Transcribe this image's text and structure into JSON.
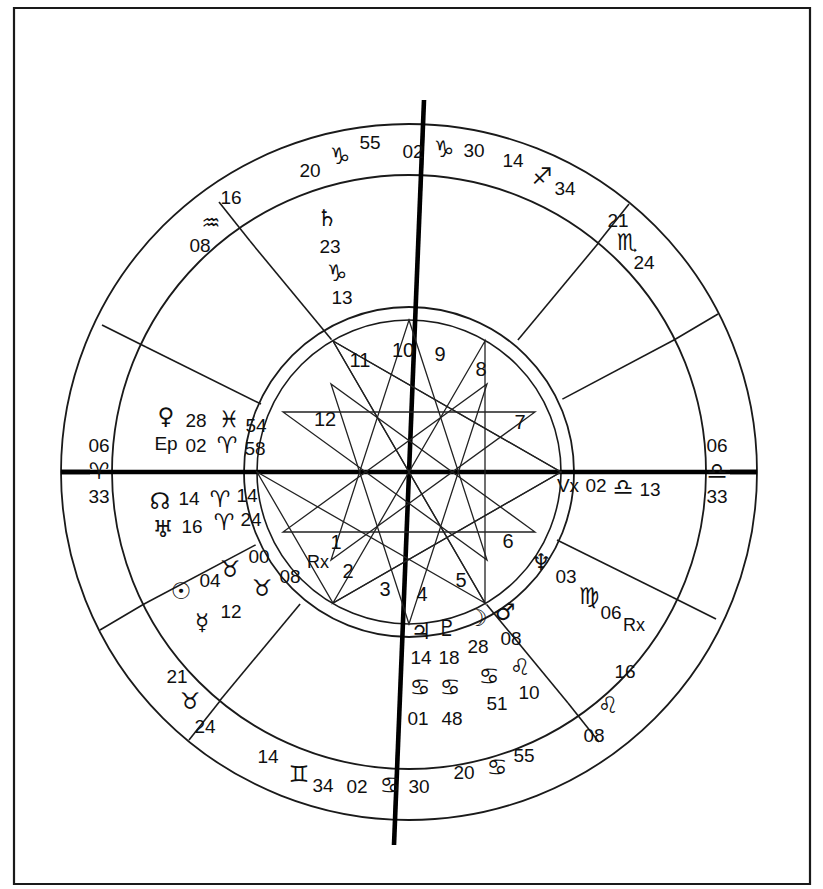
{
  "chart": {
    "type": "astrological-natal-wheel",
    "angles": {
      "ascendant": {
        "name": "Ascendant",
        "degree": "06",
        "sign_glyph": "♈",
        "sign_name": "Aries",
        "minute": "33"
      },
      "descendant": {
        "name": "Descendant",
        "degree": "06",
        "sign_glyph": "♎",
        "sign_name": "Libra",
        "minute": "33"
      },
      "midheaven": {
        "name": "Midheaven",
        "degree": "02",
        "sign_glyph": "♑",
        "sign_name": "Capricorn",
        "minute": "30"
      },
      "imum_coeli": {
        "name": "Imum Coeli",
        "degree": "02",
        "sign_glyph": "♋",
        "sign_name": "Cancer",
        "minute": "30"
      }
    },
    "house_cusps": [
      {
        "house": 1,
        "degree": "06",
        "sign_glyph": "♈",
        "sign_name": "Aries",
        "minute": "33"
      },
      {
        "house": 2,
        "degree": "21",
        "sign_glyph": "♉",
        "sign_name": "Taurus",
        "minute": "24"
      },
      {
        "house": 3,
        "degree": "14",
        "sign_glyph": "♊",
        "sign_name": "Gemini",
        "minute": "34"
      },
      {
        "house": 4,
        "degree": "02",
        "sign_glyph": "♋",
        "sign_name": "Cancer",
        "minute": "30"
      },
      {
        "house": 5,
        "degree": "20",
        "sign_glyph": "♋",
        "sign_name": "Cancer",
        "minute": "55"
      },
      {
        "house": 6,
        "degree": "16",
        "sign_glyph": "♌",
        "sign_name": "Leo",
        "minute": "08"
      },
      {
        "house": 7,
        "degree": "06",
        "sign_glyph": "♎",
        "sign_name": "Libra",
        "minute": "33"
      },
      {
        "house": 8,
        "degree": "21",
        "sign_glyph": "♏",
        "sign_name": "Scorpio",
        "minute": "24"
      },
      {
        "house": 9,
        "degree": "14",
        "sign_glyph": "♐",
        "sign_name": "Sagittarius",
        "minute": "34"
      },
      {
        "house": 10,
        "degree": "02",
        "sign_glyph": "♑",
        "sign_name": "Capricorn",
        "minute": "30"
      },
      {
        "house": 11,
        "degree": "20",
        "sign_glyph": "♑",
        "sign_name": "Capricorn",
        "minute": "55"
      },
      {
        "house": 12,
        "degree": "16",
        "sign_glyph": "♒",
        "sign_name": "Aquarius",
        "minute": "08"
      }
    ],
    "house_numbers": [
      "1",
      "2",
      "3",
      "4",
      "5",
      "6",
      "7",
      "8",
      "9",
      "10",
      "11",
      "12"
    ],
    "placements": [
      {
        "body": "Saturn",
        "glyph": "♄",
        "degree": "23",
        "sign_glyph": "♑",
        "sign_name": "Capricorn",
        "minute": "13",
        "retrograde": false
      },
      {
        "body": "Venus",
        "glyph": "♀",
        "degree": "28",
        "sign_glyph": "♓",
        "sign_name": "Pisces",
        "minute": "54",
        "retrograde": false
      },
      {
        "body": "East Point",
        "glyph": "Ep",
        "degree": "02",
        "sign_glyph": "♈",
        "sign_name": "Aries",
        "minute": "58",
        "retrograde": false
      },
      {
        "body": "North Node",
        "glyph": "☊",
        "degree": "14",
        "sign_glyph": "♈",
        "sign_name": "Aries",
        "minute": "14",
        "retrograde": false
      },
      {
        "body": "Uranus",
        "glyph": "♅",
        "degree": "16",
        "sign_glyph": "♈",
        "sign_name": "Aries",
        "minute": "24",
        "retrograde": false
      },
      {
        "body": "Chiron",
        "glyph": "♉",
        "degree": "00",
        "sign_glyph": "♉",
        "sign_name": "Taurus",
        "minute": "08",
        "retrograde": true
      },
      {
        "body": "Sun",
        "glyph": "☉",
        "degree": "04",
        "sign_glyph": "",
        "sign_name": "",
        "minute": "",
        "retrograde": false
      },
      {
        "body": "Mercury",
        "glyph": "☿",
        "degree": "12",
        "sign_glyph": "",
        "sign_name": "",
        "minute": "",
        "retrograde": false
      },
      {
        "body": "Jupiter",
        "glyph": "♃",
        "degree": "14",
        "sign_glyph": "♋",
        "sign_name": "Cancer",
        "minute": "01",
        "retrograde": false
      },
      {
        "body": "Pluto",
        "glyph": "♇",
        "degree": "18",
        "sign_glyph": "♋",
        "sign_name": "Cancer",
        "minute": "48",
        "retrograde": false
      },
      {
        "body": "Moon",
        "glyph": "☽",
        "degree": "28",
        "sign_glyph": "♋",
        "sign_name": "Cancer",
        "minute": "51",
        "retrograde": false
      },
      {
        "body": "Mars",
        "glyph": "♂",
        "degree": "08",
        "sign_glyph": "♌",
        "sign_name": "Leo",
        "minute": "10",
        "retrograde": false
      },
      {
        "body": "Neptune",
        "glyph": "♆",
        "degree": "03",
        "sign_glyph": "♍",
        "sign_name": "Virgo",
        "minute": "06",
        "retrograde": true
      },
      {
        "body": "Vertex",
        "glyph": "Vx",
        "degree": "02",
        "sign_glyph": "♎",
        "sign_name": "Libra",
        "minute": "13",
        "retrograde": false
      }
    ],
    "retrograde_marker": "Rx",
    "labels": {
      "asc_deg": "06",
      "asc_glyph": "♈",
      "asc_min": "33",
      "dsc_deg": "06",
      "dsc_glyph": "♎",
      "dsc_min": "33",
      "mc_deg": "02",
      "mc_glyph": "♑",
      "mc_min": "30",
      "ic_deg": "02",
      "ic_glyph": "♋",
      "ic_min": "30",
      "c11_deg": "20",
      "c11_glyph": "♑",
      "c11_min": "55",
      "c12_deg": "16",
      "c12_glyph": "♒",
      "c12_min": "08",
      "c9_deg": "14",
      "c9_glyph": "♐",
      "c9_min": "34",
      "c8_deg": "21",
      "c8_glyph": "♏",
      "c8_min": "24",
      "c2_deg": "21",
      "c2_glyph": "♉",
      "c2_min": "24",
      "c3_deg": "14",
      "c3_glyph": "♊",
      "c3_min": "34",
      "c5_deg": "20",
      "c5_glyph": "♋",
      "c5_min": "55",
      "c6_deg": "16",
      "c6_glyph": "♌",
      "c6_min": "08",
      "saturn_glyph": "♄",
      "saturn_deg": "23",
      "saturn_sign": "♑",
      "saturn_min": "13",
      "venus_glyph": "♀",
      "venus_deg": "28",
      "venus_sign": "♓",
      "venus_min": "54",
      "ep_glyph": "Ep",
      "ep_deg": "02",
      "ep_sign": "♈",
      "ep_min": "58",
      "node_glyph": "☊",
      "node_deg": "14",
      "node_sign": "♈",
      "node_min": "14",
      "uranus_glyph": "♅",
      "uranus_deg": "16",
      "uranus_sign": "♈",
      "uranus_min": "24",
      "chiron_glyph": "♉",
      "chiron_deg": "00",
      "chiron_sign": "♉",
      "chiron_min": "08",
      "chiron_rx": "Rx",
      "sun_glyph": "☉",
      "sun_deg": "04",
      "mercury_glyph": "☿",
      "mercury_deg": "12",
      "jupiter_glyph": "♃",
      "pluto_glyph": "♇",
      "jupiter_deg": "14",
      "pluto_deg": "18",
      "jupiter_sign": "♋",
      "pluto_sign": "♋",
      "jupiter_min": "01",
      "pluto_min": "48",
      "moon_glyph": "☽",
      "mars_glyph": "♂",
      "moon_deg": "28",
      "mars_deg": "08",
      "moon_sign": "♋",
      "mars_sign": "♌",
      "moon_min": "51",
      "mars_min": "10",
      "neptune_glyph": "♆",
      "neptune_deg": "03",
      "neptune_sign": "♍",
      "neptune_min": "06",
      "neptune_rx": "Rx",
      "vertex_glyph": "Vx",
      "vertex_deg": "02",
      "vertex_sign": "♎",
      "vertex_min": "13",
      "h1": "1",
      "h2": "2",
      "h3": "3",
      "h4": "4",
      "h5": "5",
      "h6": "6",
      "h7": "7",
      "h8": "8",
      "h9": "9",
      "h10": "10",
      "h11": "11",
      "h12": "12"
    }
  }
}
